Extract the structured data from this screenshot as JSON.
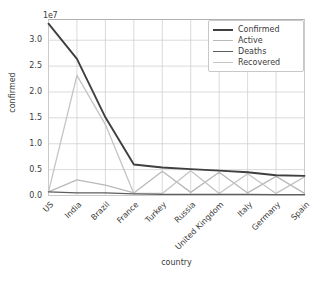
{
  "chart_data": {
    "type": "line",
    "title": "",
    "xlabel": "country",
    "ylabel": "confirmed",
    "y_offset_text": "1e7",
    "grid": true,
    "legend_position": "upper right",
    "ylim": [
      0,
      34000000
    ],
    "yticks": [
      0,
      5000000,
      10000000,
      15000000,
      20000000,
      25000000,
      30000000
    ],
    "ytick_labels": [
      "0.0",
      "0.5",
      "1.0",
      "1.5",
      "2.0",
      "2.5",
      "3.0"
    ],
    "categories": [
      "US",
      "India",
      "Brazil",
      "France",
      "Turkey",
      "Russia",
      "United Kingdom",
      "Italy",
      "Germany",
      "Spain"
    ],
    "series": [
      {
        "name": "Confirmed",
        "color": "#3f3f3f",
        "values": [
          33200000,
          26400000,
          15100000,
          6000000,
          5400000,
          5100000,
          4800000,
          4500000,
          3900000,
          3800000
        ]
      },
      {
        "name": "Active",
        "color": "#b9b9b9",
        "values": [
          700000,
          3000000,
          2000000,
          500000,
          4700000,
          600000,
          4500000,
          500000,
          3700000,
          400000
        ]
      },
      {
        "name": "Deaths",
        "color": "#5e5e5e",
        "values": [
          700000,
          500000,
          500000,
          300000,
          200000,
          200000,
          200000,
          200000,
          150000,
          150000
        ]
      },
      {
        "name": "Recovered",
        "color": "#c4c4c4",
        "values": [
          700000,
          23200000,
          13700000,
          400000,
          400000,
          4800000,
          400000,
          4200000,
          400000,
          3600000
        ]
      }
    ]
  },
  "legend": {
    "entries": [
      {
        "label": "Confirmed"
      },
      {
        "label": "Active"
      },
      {
        "label": "Deaths"
      },
      {
        "label": "Recovered"
      }
    ]
  },
  "axes": {
    "y_offset": "1e7",
    "y_title": "confirmed",
    "x_title": "country"
  }
}
